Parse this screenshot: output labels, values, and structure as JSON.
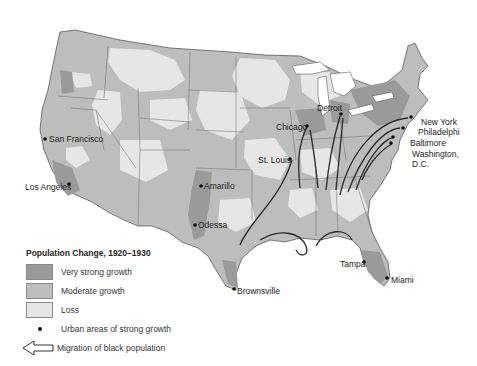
{
  "map": {
    "title": "Population Change, 1920–1930",
    "colors": {
      "very_strong_growth": "#9a9a9a",
      "moderate_growth": "#bdbdbd",
      "loss": "#e6e6e6",
      "border": "#5a5a5a",
      "migration_line": "#2a2a2a",
      "water": "#ffffff"
    },
    "cities": [
      {
        "name": "San Francisco",
        "x": 45,
        "y": 139
      },
      {
        "name": "Los Angeles",
        "x": 69,
        "y": 184
      },
      {
        "name": "Amarillo",
        "x": 201,
        "y": 186
      },
      {
        "name": "Odessa",
        "x": 195,
        "y": 225
      },
      {
        "name": "Brownsville",
        "x": 234,
        "y": 289
      },
      {
        "name": "Chicago",
        "x": 307,
        "y": 126
      },
      {
        "name": "Detroit",
        "x": 341,
        "y": 114
      },
      {
        "name": "St. Louis",
        "x": 290,
        "y": 159
      },
      {
        "name": "New York",
        "x": 411,
        "y": 117
      },
      {
        "name": "Philadelphi",
        "x": 403,
        "y": 128
      },
      {
        "name": "Baltimore",
        "x": 393,
        "y": 137
      },
      {
        "name": "Washington,",
        "x": 391,
        "y": 143
      },
      {
        "name": "D.C.",
        "x": null,
        "y": null
      },
      {
        "name": "Tampa",
        "x": 364,
        "y": 262
      },
      {
        "name": "Miami",
        "x": 387,
        "y": 278
      }
    ]
  },
  "legend": {
    "title": "Population Change, 1920–1930",
    "items": [
      {
        "label": "Very strong growth",
        "color": "#9a9a9a"
      },
      {
        "label": "Moderate growth",
        "color": "#bdbdbd"
      },
      {
        "label": "Loss",
        "color": "#e6e6e6"
      }
    ],
    "urban_label": "Urban areas of strong growth",
    "migration_label": "Migration of black population"
  },
  "labels": {
    "san_francisco": "San Francisco",
    "los_angeles": "Los Angeles",
    "amarillo": "Amarillo",
    "odessa": "Odessa",
    "brownsville": "Brownsville",
    "chicago": "Chicago",
    "detroit": "Detroit",
    "st_louis": "St. Louis",
    "new_york": "New York",
    "philadelphia": "Philadelphi",
    "baltimore": "Baltimore",
    "washington_1": "Washington,",
    "washington_2": "D.C.",
    "tampa": "Tampa",
    "miami": "Miami"
  }
}
